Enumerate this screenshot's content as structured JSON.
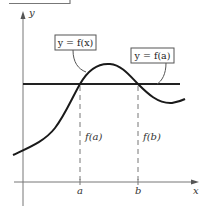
{
  "figure": {
    "axes": {
      "x_label": "x",
      "y_label": "y"
    },
    "x_ticks": [
      {
        "label": "a",
        "x": 80
      },
      {
        "label": "b",
        "x": 138
      }
    ],
    "dashed_labels": [
      {
        "label": "f(a)",
        "x": 86,
        "y": 137
      },
      {
        "label": "f(b)",
        "x": 144,
        "y": 137
      }
    ],
    "callouts": [
      {
        "label": "y = f(x)"
      },
      {
        "label": "y = f(a)"
      }
    ],
    "colors": {
      "curve": "#1a1a1a",
      "axes": "#666666",
      "dashed": "#777777",
      "background": "#ffffff"
    }
  }
}
